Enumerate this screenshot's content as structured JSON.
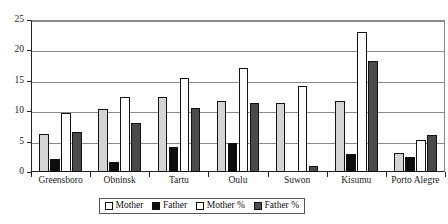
{
  "chart_data": {
    "type": "bar",
    "title": "",
    "subtitle": "",
    "xlabel": "",
    "ylabel": "",
    "ylim": [
      0,
      25
    ],
    "yticks": [
      0,
      5,
      10,
      15,
      20,
      25
    ],
    "ytick_labels": [
      "0",
      "5",
      "10",
      "15",
      "20",
      "25"
    ],
    "grid": true,
    "grid_axis": "y",
    "legend_position": "bottom-center",
    "categories": [
      "Greensboro",
      "Obninsk",
      "Tartu",
      "Oulu",
      "Suwon",
      "Kisumu",
      "Porto Alegre"
    ],
    "series": [
      {
        "name": "Mother",
        "color": "#d4d4d4",
        "values": [
          6.2,
          10.3,
          12.4,
          11.7,
          11.4,
          11.7,
          3.2
        ]
      },
      {
        "name": "Father",
        "color": "#0d0d0d",
        "values": [
          2.2,
          1.6,
          4.1,
          4.7,
          0.0,
          3.0,
          2.4
        ]
      },
      {
        "name": "Mother %",
        "color": "#ffffff",
        "values": [
          9.7,
          12.3,
          15.4,
          17.1,
          14.2,
          23.0,
          5.2
        ]
      },
      {
        "name": "Father %",
        "color": "#4a4a4a",
        "values": [
          6.6,
          8.0,
          10.6,
          11.4,
          1.0,
          18.3,
          6.1
        ]
      }
    ]
  },
  "legend": {
    "items": [
      {
        "label": "Mother",
        "swatch": "mother"
      },
      {
        "label": "Father",
        "swatch": "father"
      },
      {
        "label": "Mother %",
        "swatch": "motherpct"
      },
      {
        "label": "Father %",
        "swatch": "fatherpct"
      }
    ]
  }
}
